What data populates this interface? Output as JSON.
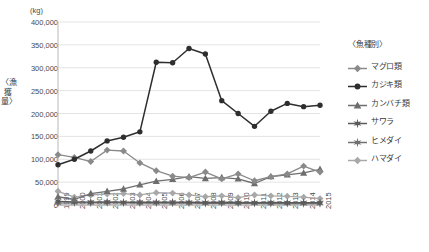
{
  "chart_data": {
    "type": "line",
    "title": "",
    "unit_label": "(kg)",
    "ylabel": "〈漁獲量〉",
    "xlabel": "",
    "grid": true,
    "legend_position": "right",
    "legend_title": "〈魚種別〉",
    "ylim": [
      0,
      400000
    ],
    "yticks": [
      400000,
      350000,
      300000,
      250000,
      200000,
      150000,
      100000,
      50000,
      0
    ],
    "ytick_labels": [
      "400,000",
      "350,000",
      "300,000",
      "250,000",
      "200,000",
      "150,000",
      "100,000",
      "50,000",
      "0"
    ],
    "categories": [
      "1999",
      "2000",
      "2001",
      "2002",
      "2003",
      "2004",
      "2005",
      "2006",
      "2007",
      "2008",
      "2009",
      "2010",
      "2011",
      "2012",
      "2013",
      "2014",
      "2015"
    ],
    "series": [
      {
        "name": "マグロ類",
        "color": "#8a8a8a",
        "marker": "diamond",
        "values": [
          110000,
          104000,
          95000,
          120000,
          118000,
          92000,
          75000,
          63000,
          60000,
          72000,
          57000,
          68000,
          53000,
          62000,
          68000,
          85000,
          72000
        ]
      },
      {
        "name": "カジキ類",
        "color": "#2e2e2e",
        "marker": "circle",
        "values": [
          88000,
          100000,
          118000,
          140000,
          148000,
          160000,
          312000,
          311000,
          342000,
          330000,
          228000,
          200000,
          172000,
          205000,
          222000,
          215000,
          218000
        ]
      },
      {
        "name": "カンバチ類",
        "color": "#6e6e6e",
        "marker": "triangle",
        "values": [
          18000,
          12000,
          25000,
          30000,
          35000,
          44000,
          52000,
          56000,
          62000,
          58000,
          60000,
          57000,
          47000,
          62000,
          66000,
          70000,
          78000
        ]
      },
      {
        "name": "サワラ",
        "color": "#5a5a5a",
        "marker": "star",
        "values": [
          8000,
          7000,
          6500,
          7000,
          6000,
          6500,
          6000,
          6500,
          6000,
          5500,
          6000,
          5500,
          5000,
          5500,
          5000,
          5000,
          5000
        ]
      },
      {
        "name": "ヒメダイ",
        "color": "#707070",
        "marker": "star",
        "values": [
          4000,
          5000,
          4500,
          5000,
          4500,
          4000,
          4500,
          4000,
          4000,
          3500,
          4000,
          3500,
          3500,
          3000,
          3500,
          3000,
          3000
        ]
      },
      {
        "name": "ハマダイ",
        "color": "#a8a8a8",
        "marker": "diamond",
        "values": [
          30000,
          17000,
          22000,
          24000,
          25000,
          22000,
          27000,
          26000,
          22000,
          18000,
          20000,
          16000,
          22000,
          20000,
          19000,
          17000,
          14000
        ]
      }
    ]
  }
}
